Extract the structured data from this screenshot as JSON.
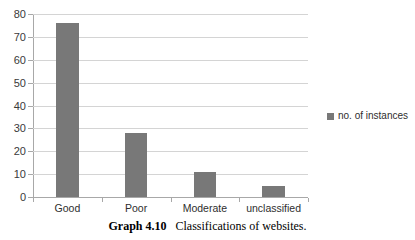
{
  "caption": {
    "label": "Graph 4.10",
    "text": "Classifications of websites."
  },
  "legend": {
    "entries": [
      {
        "label": "no. of instances",
        "color": "#787878"
      }
    ]
  },
  "colors": {
    "bar": "#787878",
    "gridline": "#d4d4d4",
    "axis": "#a8a8a8",
    "background": "#ffffff"
  },
  "chart_data": {
    "type": "bar",
    "title": "",
    "subtitle": "",
    "xlabel": "",
    "ylabel": "",
    "categories": [
      "Good",
      "Poor",
      "Moderate",
      "unclassified"
    ],
    "series": [
      {
        "name": "no. of instances",
        "values": [
          76,
          28,
          11,
          5
        ]
      }
    ],
    "values": [
      76,
      28,
      11,
      5
    ],
    "ylim": [
      0,
      80
    ],
    "ytick_step": 10,
    "yticks": [
      0,
      10,
      20,
      30,
      40,
      50,
      60,
      70,
      80
    ],
    "ytick_labels": [
      "0",
      "10",
      "20",
      "30",
      "40",
      "50",
      "60",
      "70",
      "80"
    ],
    "grid": true,
    "grid_axis": "y",
    "legend_position": "right"
  }
}
